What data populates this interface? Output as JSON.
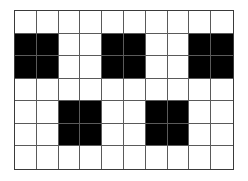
{
  "grid": {
    "rows": 7,
    "cols": 10,
    "filled_color": "#000000",
    "empty_color": "#ffffff",
    "filled_blocks": [
      {
        "row": 1,
        "col": 0,
        "height": 2,
        "width": 2
      },
      {
        "row": 1,
        "col": 4,
        "height": 2,
        "width": 2
      },
      {
        "row": 1,
        "col": 8,
        "height": 2,
        "width": 2
      },
      {
        "row": 4,
        "col": 2,
        "height": 2,
        "width": 2
      },
      {
        "row": 4,
        "col": 6,
        "height": 2,
        "width": 2
      }
    ]
  }
}
